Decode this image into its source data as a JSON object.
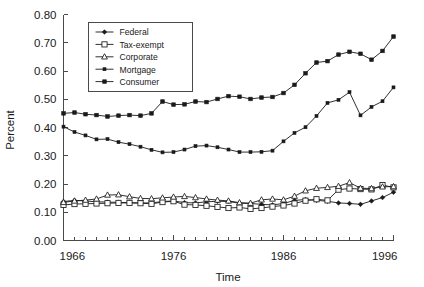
{
  "chart_data": {
    "type": "line",
    "title": "",
    "xlabel": "Time",
    "ylabel": "Percent",
    "xlim": [
      1966,
      1996
    ],
    "ylim": [
      0.0,
      0.8
    ],
    "grid": false,
    "legend_position": "top-left-inside",
    "x_tick_labels": [
      "1966",
      "1976",
      "1986",
      "1996"
    ],
    "x_tick_values": [
      1966,
      1976,
      1986,
      1996
    ],
    "x_minor_ticks_every": 1,
    "y_tick_labels": [
      "0.00",
      "0.10",
      "0.20",
      "0.30",
      "0.40",
      "0.50",
      "0.60",
      "0.70",
      "0.80"
    ],
    "y_tick_values": [
      0.0,
      0.1,
      0.2,
      0.3,
      0.4,
      0.5,
      0.6,
      0.7,
      0.8
    ],
    "x": [
      1966,
      1967,
      1968,
      1969,
      1970,
      1971,
      1972,
      1973,
      1974,
      1975,
      1976,
      1977,
      1978,
      1979,
      1980,
      1981,
      1982,
      1983,
      1984,
      1985,
      1986,
      1987,
      1988,
      1989,
      1990,
      1991,
      1992,
      1993,
      1994,
      1995,
      1996
    ],
    "series": [
      {
        "name": "Federal",
        "marker": "diamond-filled",
        "values": [
          0.138,
          0.142,
          0.14,
          0.137,
          0.136,
          0.135,
          0.134,
          0.133,
          0.133,
          0.138,
          0.14,
          0.134,
          0.133,
          0.137,
          0.139,
          0.138,
          0.132,
          0.131,
          0.128,
          0.126,
          0.131,
          0.142,
          0.145,
          0.142,
          0.139,
          0.133,
          0.131,
          0.128,
          0.14,
          0.152,
          0.171
        ]
      },
      {
        "name": "Tax-exempt",
        "marker": "square-open",
        "values": [
          0.126,
          0.129,
          0.13,
          0.131,
          0.132,
          0.133,
          0.133,
          0.132,
          0.13,
          0.136,
          0.139,
          0.127,
          0.126,
          0.123,
          0.119,
          0.115,
          0.117,
          0.112,
          0.115,
          0.12,
          0.124,
          0.131,
          0.141,
          0.146,
          0.142,
          0.18,
          0.184,
          0.182,
          0.181,
          0.196,
          0.188
        ]
      },
      {
        "name": "Corporate",
        "marker": "triangle-open",
        "values": [
          0.135,
          0.14,
          0.143,
          0.147,
          0.161,
          0.162,
          0.155,
          0.149,
          0.148,
          0.151,
          0.154,
          0.156,
          0.152,
          0.147,
          0.143,
          0.14,
          0.134,
          0.132,
          0.144,
          0.147,
          0.144,
          0.157,
          0.176,
          0.185,
          0.188,
          0.192,
          0.205,
          0.185,
          0.184,
          0.19,
          0.191
        ]
      },
      {
        "name": "Mortgage",
        "marker": "square-small-filled",
        "values": [
          0.403,
          0.384,
          0.372,
          0.358,
          0.359,
          0.348,
          0.341,
          0.332,
          0.321,
          0.312,
          0.313,
          0.322,
          0.334,
          0.336,
          0.33,
          0.322,
          0.313,
          0.313,
          0.314,
          0.318,
          0.351,
          0.381,
          0.401,
          0.441,
          0.487,
          0.498,
          0.525,
          0.443,
          0.473,
          0.493,
          0.542
        ]
      },
      {
        "name": "Consumer",
        "marker": "square-filled",
        "values": [
          0.45,
          0.453,
          0.447,
          0.444,
          0.439,
          0.442,
          0.444,
          0.442,
          0.45,
          0.492,
          0.481,
          0.482,
          0.492,
          0.49,
          0.501,
          0.511,
          0.509,
          0.501,
          0.506,
          0.508,
          0.522,
          0.551,
          0.592,
          0.63,
          0.635,
          0.658,
          0.668,
          0.661,
          0.64,
          0.671,
          0.722
        ]
      }
    ]
  },
  "legend": {
    "entries": [
      {
        "label": "Federal"
      },
      {
        "label": "Tax-exempt"
      },
      {
        "label": "Corporate"
      },
      {
        "label": "Mortgage"
      },
      {
        "label": "Consumer"
      }
    ]
  },
  "colors": {
    "line": "#1a1a1a",
    "axis": "#4a4a4a",
    "background": "#ffffff",
    "marker_fill": "#1a1a1a",
    "marker_open_fill": "#ffffff"
  }
}
